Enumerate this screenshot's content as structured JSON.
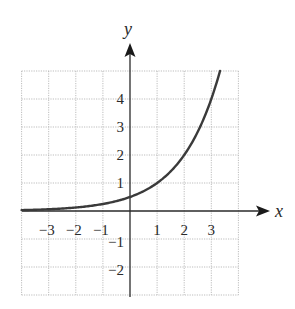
{
  "chart_data": {
    "type": "line",
    "title": "",
    "xlabel": "x",
    "ylabel": "y",
    "xlim": [
      -4,
      4
    ],
    "ylim": [
      -3,
      5
    ],
    "grid": true,
    "grid_style": "dotted",
    "x_ticks": [
      -3,
      -2,
      -1,
      1,
      2,
      3
    ],
    "y_ticks": [
      -2,
      -1,
      1,
      2,
      3,
      4
    ],
    "x_tick_labels": [
      "−3",
      "−2",
      "−1",
      "1",
      "2",
      "3"
    ],
    "y_tick_labels": [
      "−2",
      "−1",
      "1",
      "2",
      "3",
      "4"
    ],
    "series": [
      {
        "name": "curve",
        "function": "y = 2^(x-1)",
        "x": [
          -4,
          -3,
          -2,
          -1,
          0,
          1,
          2,
          3,
          3.32
        ],
        "y": [
          0.03,
          0.06,
          0.13,
          0.25,
          0.5,
          1,
          2,
          4,
          5
        ]
      }
    ]
  },
  "labels": {
    "x_axis": "x",
    "y_axis": "y"
  },
  "colors": {
    "curve": "#3a3a3a",
    "axis": "#2a2a2a",
    "grid": "#b5b5b5"
  }
}
